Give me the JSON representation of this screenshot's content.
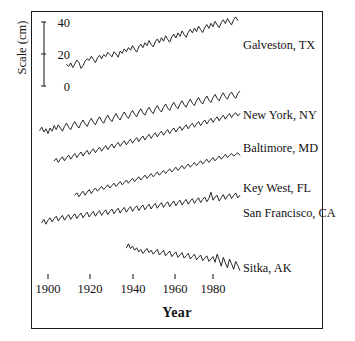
{
  "figure": {
    "background": "#ffffff",
    "frame_color": "#1a1a1a",
    "line_color": "#111111"
  },
  "axis": {
    "y_title": "Scale (cm)",
    "x_title": "Year",
    "y_ticks": [
      "40",
      "20",
      "0"
    ],
    "x_ticks": [
      "1900",
      "1920",
      "1940",
      "1960",
      "1980"
    ]
  },
  "chart_data": {
    "type": "line",
    "title": "",
    "subtitle": "",
    "xlabel": "Year",
    "ylabel": "Scale (cm)",
    "xlim": [
      1893,
      1996
    ],
    "ylim_scalebar": [
      0,
      40
    ],
    "scalebar_ticks": [
      0,
      20,
      40
    ],
    "grid": false,
    "legend_position": "right-inline",
    "x_tick_values": [
      1900,
      1920,
      1940,
      1960,
      1980
    ],
    "series": [
      {
        "name": "Galveston, TX",
        "label": "Galveston, TX",
        "start_year": 1909,
        "end_year": 1992,
        "trend": "rising",
        "values": [
          -1.5,
          -2.8,
          -0.6,
          -3.5,
          -1.2,
          1.2,
          -0.3,
          -4.0,
          -2.3,
          0.6,
          2.0,
          1.0,
          3.6,
          1.6,
          -0.4,
          2.6,
          4.2,
          2.0,
          4.6,
          3.4,
          6.0,
          4.6,
          3.2,
          6.4,
          5.0,
          3.0,
          6.8,
          5.4,
          8.2,
          6.4,
          9.0,
          7.4,
          10.2,
          8.0,
          6.2,
          9.4,
          11.2,
          9.0,
          12.0,
          10.2,
          13.4,
          11.0,
          9.4,
          12.6,
          14.4,
          12.0,
          15.2,
          13.0,
          16.4,
          14.2,
          12.4,
          15.6,
          17.4,
          15.0,
          18.2,
          16.0,
          19.4,
          17.2,
          15.4,
          18.6,
          20.4,
          18.2,
          21.2,
          19.0,
          22.4,
          20.2,
          18.4,
          21.6,
          23.4,
          21.0,
          24.2,
          22.0,
          25.4,
          23.2,
          21.4,
          24.6,
          26.4,
          24.0,
          27.2,
          25.0,
          23.2,
          26.4,
          28.2,
          26.0
        ]
      },
      {
        "name": "New York, NY",
        "label": "New York, NY",
        "start_year": 1896,
        "end_year": 1993,
        "trend": "rising",
        "values": [
          -4.0,
          -2.0,
          -5.0,
          -3.0,
          -6.0,
          -2.5,
          -4.5,
          -1.0,
          -3.5,
          -0.5,
          -2.5,
          -4.5,
          -1.5,
          0.5,
          -2.0,
          -3.5,
          -0.5,
          1.5,
          -1.0,
          -2.5,
          0.5,
          2.5,
          0.0,
          -1.5,
          1.5,
          3.5,
          1.0,
          -0.5,
          2.5,
          4.5,
          2.0,
          0.5,
          3.5,
          5.5,
          3.0,
          1.5,
          4.5,
          6.5,
          4.0,
          2.5,
          5.5,
          7.5,
          5.0,
          3.5,
          6.5,
          8.5,
          6.0,
          4.5,
          7.5,
          9.5,
          7.0,
          5.5,
          8.5,
          10.5,
          8.0,
          6.5,
          9.5,
          11.5,
          9.0,
          7.5,
          10.5,
          12.5,
          10.0,
          8.5,
          11.5,
          13.5,
          11.0,
          9.5,
          12.5,
          14.5,
          12.0,
          10.5,
          13.5,
          15.5,
          13.0,
          11.5,
          14.5,
          16.5,
          14.0,
          12.5,
          15.5,
          17.5,
          15.0,
          13.5,
          16.5,
          18.5,
          16.0,
          14.5,
          17.5,
          19.5,
          17.0,
          15.5,
          18.5,
          20.0,
          17.5,
          16.0,
          19.0,
          20.5
        ]
      },
      {
        "name": "Baltimore, MD",
        "label": "Baltimore, MD",
        "start_year": 1903,
        "end_year": 1993,
        "trend": "rising",
        "values": [
          -3.0,
          -1.5,
          -4.0,
          -2.0,
          -0.5,
          -3.0,
          -1.0,
          0.5,
          -2.0,
          0.0,
          1.5,
          -1.0,
          1.0,
          2.5,
          0.0,
          2.0,
          3.5,
          1.0,
          3.0,
          4.5,
          2.0,
          4.0,
          5.5,
          3.0,
          5.0,
          6.5,
          4.0,
          6.0,
          7.5,
          5.0,
          7.0,
          8.5,
          6.0,
          8.0,
          9.5,
          7.0,
          9.0,
          10.5,
          8.0,
          10.0,
          11.5,
          9.0,
          11.0,
          12.5,
          10.0,
          12.0,
          13.5,
          11.0,
          13.0,
          14.5,
          12.0,
          14.0,
          15.5,
          13.0,
          15.0,
          16.5,
          14.0,
          16.0,
          17.5,
          15.0,
          17.0,
          18.5,
          16.0,
          18.0,
          19.5,
          17.0,
          19.0,
          20.5,
          18.0,
          20.0,
          21.5,
          19.0,
          21.0,
          22.5,
          20.0,
          22.0,
          23.5,
          21.0,
          23.0,
          24.5,
          22.0,
          24.0,
          25.5,
          23.0,
          25.0,
          26.5,
          24.0,
          26.0,
          27.0,
          25.0,
          26.5
        ]
      },
      {
        "name": "Key West, FL",
        "label": "Key West, FL",
        "start_year": 1913,
        "end_year": 1993,
        "trend": "rising",
        "values": [
          -2.0,
          -0.5,
          -3.0,
          -1.0,
          0.5,
          -2.0,
          0.0,
          1.5,
          -1.0,
          1.0,
          2.5,
          0.5,
          2.0,
          3.5,
          1.5,
          3.0,
          4.5,
          2.5,
          4.0,
          5.5,
          3.5,
          5.0,
          6.5,
          4.5,
          6.0,
          7.5,
          5.5,
          7.0,
          8.5,
          6.5,
          8.0,
          9.5,
          7.5,
          9.0,
          10.5,
          8.5,
          10.0,
          11.5,
          9.5,
          11.0,
          12.5,
          10.5,
          12.0,
          13.5,
          11.5,
          13.0,
          14.5,
          12.5,
          14.0,
          15.5,
          13.5,
          15.0,
          16.5,
          14.5,
          16.0,
          17.5,
          15.5,
          17.0,
          18.5,
          16.5,
          18.0,
          19.5,
          17.5,
          19.0,
          20.5,
          18.5,
          20.0,
          21.5,
          19.5,
          21.0,
          22.5,
          20.5,
          22.0,
          23.5,
          21.5,
          23.0,
          24.0,
          22.5,
          23.5,
          24.5,
          23.0
        ]
      },
      {
        "name": "San Francisco, CA",
        "label": "San Francisco, CA",
        "start_year": 1897,
        "end_year": 1993,
        "trend": "rising",
        "values": [
          -1.0,
          1.0,
          -2.0,
          0.5,
          2.0,
          -0.5,
          1.5,
          3.0,
          0.0,
          2.0,
          3.5,
          0.5,
          2.5,
          4.0,
          1.0,
          3.0,
          4.5,
          1.5,
          3.5,
          5.0,
          2.0,
          4.0,
          5.5,
          2.5,
          4.5,
          6.0,
          3.0,
          5.0,
          6.5,
          3.5,
          5.5,
          7.0,
          4.0,
          6.0,
          7.5,
          4.5,
          6.5,
          8.0,
          5.0,
          7.0,
          8.5,
          5.5,
          7.5,
          9.0,
          6.0,
          8.0,
          9.5,
          6.5,
          8.5,
          10.0,
          7.0,
          9.0,
          10.5,
          7.5,
          9.5,
          11.0,
          8.0,
          10.0,
          11.5,
          8.5,
          10.5,
          12.0,
          9.0,
          11.0,
          12.5,
          9.5,
          11.5,
          13.0,
          10.0,
          12.0,
          13.5,
          10.5,
          12.5,
          14.0,
          11.0,
          13.0,
          14.5,
          11.5,
          13.5,
          15.0,
          12.0,
          14.0,
          18.0,
          13.0,
          15.0,
          16.0,
          12.5,
          14.5,
          16.5,
          13.5,
          15.5,
          17.0,
          14.0,
          16.0,
          17.5,
          14.5,
          16.0
        ]
      },
      {
        "name": "Sitka, AK",
        "label": "Sitka, AK",
        "start_year": 1938,
        "end_year": 1993,
        "trend": "falling",
        "values": [
          2.0,
          4.5,
          1.5,
          3.0,
          0.5,
          2.0,
          -0.5,
          1.0,
          -1.5,
          0.0,
          1.5,
          -1.0,
          0.5,
          -2.0,
          -0.5,
          1.0,
          -2.5,
          -1.0,
          0.5,
          -3.0,
          -1.5,
          0.0,
          -3.5,
          -2.0,
          -0.5,
          -4.0,
          -2.5,
          -1.0,
          -4.5,
          -3.0,
          -1.5,
          -5.0,
          -3.5,
          -2.0,
          -5.5,
          -4.0,
          -2.5,
          -6.0,
          -4.5,
          -3.0,
          -6.5,
          -5.0,
          -3.5,
          -7.0,
          -2.0,
          -5.5,
          -9.5,
          -4.0,
          -7.5,
          -10.5,
          -5.0,
          -8.0,
          -11.5,
          -6.5,
          -9.0,
          -12.0
        ]
      }
    ]
  }
}
